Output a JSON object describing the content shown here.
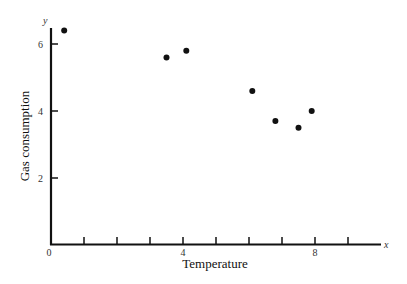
{
  "chart_data": {
    "type": "scatter",
    "title": "",
    "xlabel": "Temperature",
    "ylabel": "Gas consumption",
    "x_axis_letter": "x",
    "y_axis_letter": "y",
    "xlim": [
      0,
      10
    ],
    "ylim": [
      0,
      6.6
    ],
    "x_ticks": [
      1,
      2,
      3,
      4,
      5,
      6,
      7,
      8,
      9
    ],
    "x_tick_labels": [
      {
        "value": 0,
        "label": "0"
      },
      {
        "value": 4,
        "label": "4"
      },
      {
        "value": 8,
        "label": "8"
      }
    ],
    "y_ticks": [
      2,
      4,
      6
    ],
    "y_tick_labels": [
      {
        "value": 2,
        "label": "2"
      },
      {
        "value": 4,
        "label": "4"
      },
      {
        "value": 6,
        "label": "6"
      }
    ],
    "grid": false,
    "legend": null,
    "points": [
      {
        "x": 0.4,
        "y": 6.4
      },
      {
        "x": 3.5,
        "y": 5.6
      },
      {
        "x": 4.1,
        "y": 5.8
      },
      {
        "x": 6.1,
        "y": 4.6
      },
      {
        "x": 6.8,
        "y": 3.7
      },
      {
        "x": 7.5,
        "y": 3.5
      },
      {
        "x": 7.9,
        "y": 4.0
      }
    ],
    "colors": {
      "axis": "#111111",
      "points": "#111111"
    }
  }
}
